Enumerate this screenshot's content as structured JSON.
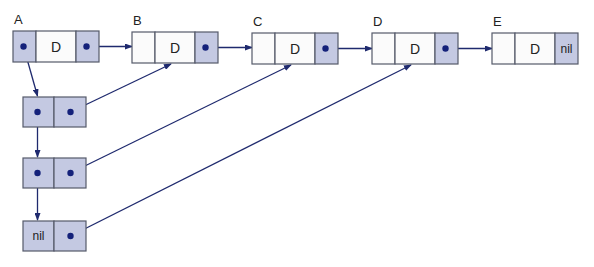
{
  "colors": {
    "shade": "#c4c9e2",
    "white": "#fbfbfb",
    "border": "#555a6a",
    "arrow": "#1f2a6e",
    "dot": "#14217a"
  },
  "top_nodes": [
    {
      "label": "A",
      "left": "ptr-dot",
      "data": "D",
      "right": "ptr-dot",
      "left_shaded": true
    },
    {
      "label": "B",
      "left": "",
      "data": "D",
      "right": "ptr-dot",
      "left_shaded": false
    },
    {
      "label": "C",
      "left": "",
      "data": "D",
      "right": "ptr-dot",
      "left_shaded": false
    },
    {
      "label": "D",
      "left": "",
      "data": "D",
      "right": "ptr-dot",
      "left_shaded": false
    },
    {
      "label": "E",
      "left": "",
      "data": "D",
      "right": "nil",
      "left_shaded": false
    }
  ],
  "side_nodes": [
    {
      "left": "ptr-dot",
      "right": "ptr-dot",
      "points_to": "B"
    },
    {
      "left": "ptr-dot",
      "right": "ptr-dot",
      "points_to": "C"
    },
    {
      "left": "nil",
      "right": "ptr-dot",
      "points_to": "D"
    }
  ]
}
